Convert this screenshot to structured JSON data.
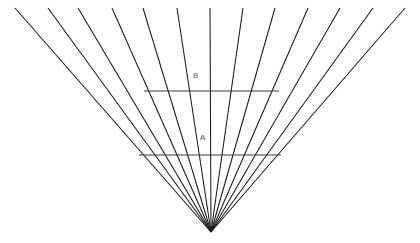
{
  "figure": {
    "background_color": "#ffffff",
    "line_color": "#1a1a1a",
    "transversal_color": "#3a3a3a",
    "width": 420,
    "height": 243,
    "labels": [
      {
        "id": "B",
        "text": "B",
        "x": 196,
        "y": 76
      },
      {
        "id": "A",
        "text": "A",
        "x": 203,
        "y": 138
      }
    ]
  },
  "chart_data": {
    "type": "line",
    "subtitle": "",
    "xlabel": "",
    "ylabel": "",
    "xlim": [
      0,
      420
    ],
    "ylim": [
      243,
      0
    ],
    "grid": false,
    "legend": "none",
    "annotations": [
      {
        "text": "B",
        "x": 196,
        "y": 76
      },
      {
        "text": "A",
        "x": 203,
        "y": 138
      }
    ],
    "apex": {
      "x": 211,
      "y": 232
    },
    "fan_lines": [
      {
        "x1": 15,
        "y1": 8,
        "x2": 211,
        "y2": 232
      },
      {
        "x1": 48,
        "y1": 8,
        "x2": 211,
        "y2": 232
      },
      {
        "x1": 78,
        "y1": 8,
        "x2": 211,
        "y2": 232
      },
      {
        "x1": 112,
        "y1": 8,
        "x2": 211,
        "y2": 232
      },
      {
        "x1": 143,
        "y1": 8,
        "x2": 211,
        "y2": 232
      },
      {
        "x1": 177,
        "y1": 8,
        "x2": 211,
        "y2": 232
      },
      {
        "x1": 210,
        "y1": 8,
        "x2": 211,
        "y2": 232
      },
      {
        "x1": 243,
        "y1": 8,
        "x2": 211,
        "y2": 232
      },
      {
        "x1": 275,
        "y1": 8,
        "x2": 211,
        "y2": 232
      },
      {
        "x1": 308,
        "y1": 8,
        "x2": 211,
        "y2": 232
      },
      {
        "x1": 340,
        "y1": 8,
        "x2": 211,
        "y2": 232
      },
      {
        "x1": 373,
        "y1": 8,
        "x2": 211,
        "y2": 232
      },
      {
        "x1": 405,
        "y1": 8,
        "x2": 211,
        "y2": 232
      }
    ],
    "transversals": [
      {
        "id": "B",
        "x1": 144,
        "y1": 91,
        "x2": 279,
        "y2": 91
      },
      {
        "id": "A",
        "x1": 139,
        "y1": 155,
        "x2": 281,
        "y2": 155
      }
    ],
    "series": [
      {
        "name": "fan-lines",
        "count": 13,
        "description": "Radiating straight lines from top edge converging at apex"
      },
      {
        "name": "transversals",
        "count": 2,
        "description": "Two equal-length horizontal segments labeled B (upper) and A (lower)"
      }
    ]
  }
}
